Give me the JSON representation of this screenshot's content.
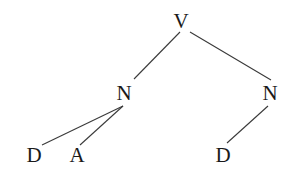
{
  "diagram": {
    "type": "tree",
    "nodes": [
      {
        "id": "v",
        "label": "V",
        "x": 181,
        "y": 21
      },
      {
        "id": "n1",
        "label": "N",
        "x": 124,
        "y": 93
      },
      {
        "id": "n2",
        "label": "N",
        "x": 270,
        "y": 93
      },
      {
        "id": "d1",
        "label": "D",
        "x": 34,
        "y": 155
      },
      {
        "id": "a1",
        "label": "A",
        "x": 77,
        "y": 155
      },
      {
        "id": "d2",
        "label": "D",
        "x": 223,
        "y": 155
      }
    ],
    "edges": [
      {
        "from": "v",
        "to": "n1",
        "x1": 180,
        "y1": 32,
        "x2": 134,
        "y2": 79
      },
      {
        "from": "v",
        "to": "n2",
        "x1": 190,
        "y1": 32,
        "x2": 271,
        "y2": 80
      },
      {
        "from": "n1",
        "to": "d1",
        "x1": 123,
        "y1": 106,
        "x2": 42,
        "y2": 145
      },
      {
        "from": "n1",
        "to": "a1",
        "x1": 123,
        "y1": 106,
        "x2": 80,
        "y2": 145
      },
      {
        "from": "n2",
        "to": "d2",
        "x1": 268,
        "y1": 106,
        "x2": 227,
        "y2": 143
      }
    ]
  }
}
